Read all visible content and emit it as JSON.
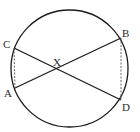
{
  "diagram": {
    "type": "circle-intersecting-chords",
    "circle": {
      "cx": 69.5,
      "cy": 68.5,
      "r": 58.5,
      "stroke": "#1a1a1a"
    },
    "points": {
      "A": {
        "label": "A",
        "x": 15,
        "y": 88,
        "lx": 4,
        "ly": 97
      },
      "B": {
        "label": "B",
        "x": 121,
        "y": 38,
        "lx": 122,
        "ly": 37
      },
      "C": {
        "label": "C",
        "x": 14,
        "y": 48,
        "lx": 3,
        "ly": 48
      },
      "D": {
        "label": "D",
        "x": 121,
        "y": 100,
        "lx": 122,
        "ly": 111
      },
      "X": {
        "label": "X",
        "x": 58,
        "y": 69,
        "lx": 53,
        "ly": 66
      }
    },
    "solid_chords": [
      {
        "from": "A",
        "to": "B"
      },
      {
        "from": "C",
        "to": "D"
      }
    ],
    "dashed_segments": [
      {
        "from": "C",
        "to": "A"
      },
      {
        "from": "B",
        "to": "D"
      }
    ],
    "colors": {
      "line": "#1a1a1a",
      "dashed": "#555555",
      "text": "#2a2a2a"
    }
  }
}
